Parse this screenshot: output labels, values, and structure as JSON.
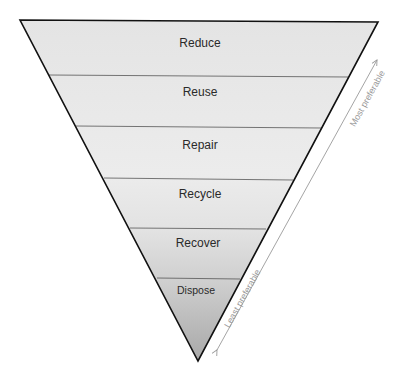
{
  "diagram": {
    "type": "inverted-pyramid",
    "levels": [
      {
        "label": "Reduce",
        "fill": "#e6e6e6"
      },
      {
        "label": "Reuse",
        "fill": "#e9e9e9"
      },
      {
        "label": "Repair",
        "fill": "#ebebeb"
      },
      {
        "label": "Recycle",
        "fill": "#e4e4e4"
      },
      {
        "label": "Recover",
        "fill": "#cfcfcf"
      },
      {
        "label": "Dispose",
        "fill": "#b5b5b5"
      }
    ],
    "arrow": {
      "top_label": "Most preferable",
      "bottom_label": "Least preferable",
      "color": "#9a9a9a"
    }
  }
}
